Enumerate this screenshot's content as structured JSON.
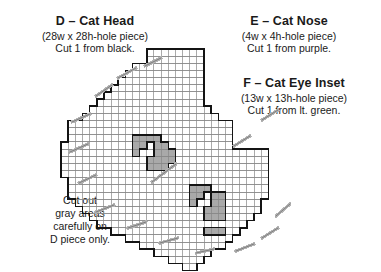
{
  "pieces": [
    {
      "id": "D",
      "title": "D – Cat Head",
      "size_line": "(28w x 28h-hole piece)",
      "cut_line": "Cut 1 from black.",
      "width_holes": 28,
      "height_holes": 28,
      "count": 1,
      "color_name": "black"
    },
    {
      "id": "E",
      "title": "E – Cat Nose",
      "size_line": "(4w x 4h-hole piece)",
      "cut_line": "Cut 1 from purple.",
      "width_holes": 4,
      "height_holes": 4,
      "count": 1,
      "color_name": "purple"
    },
    {
      "id": "F",
      "title": "F – Cat Eye Inset",
      "size_line": "(13w x 13h-hole piece)",
      "cut_line": "Cut 1 from lt. green.",
      "width_holes": 13,
      "height_holes": 13,
      "count": 1,
      "color_name": "lt. green"
    }
  ],
  "note": {
    "line1": "Cut out",
    "line2": "gray areas",
    "line3": "carefully on",
    "line4": "D piece only."
  },
  "colors": {
    "ink": "#1a1a1a",
    "grid_line": "#888888",
    "outline": "#141414",
    "cutout_fill": "#a9a9a9",
    "paper": "#ffffff"
  },
  "chart_data": {
    "type": "grid-pattern",
    "cell_px": 7.15,
    "origin_x": 61,
    "origin_y": 49,
    "cols": 31,
    "rows": 31,
    "outline_note": "Stepped circular head outline, 28 holes wide at center",
    "row_spans": [
      {
        "r": 0,
        "c0": 12,
        "c1": 19
      },
      {
        "r": 1,
        "c0": 12,
        "c1": 19
      },
      {
        "r": 2,
        "c0": 10,
        "c1": 19
      },
      {
        "r": 3,
        "c0": 9,
        "c1": 19
      },
      {
        "r": 4,
        "c0": 8,
        "c1": 19
      },
      {
        "r": 5,
        "c0": 7,
        "c1": 19
      },
      {
        "r": 6,
        "c0": 6,
        "c1": 19
      },
      {
        "r": 7,
        "c0": 5,
        "c1": 19
      },
      {
        "r": 8,
        "c0": 4,
        "c1": 20
      },
      {
        "r": 9,
        "c0": 3,
        "c1": 21
      },
      {
        "r": 10,
        "c0": 1,
        "c1": 23
      },
      {
        "r": 11,
        "c0": 1,
        "c1": 23
      },
      {
        "r": 12,
        "c0": 1,
        "c1": 23
      },
      {
        "r": 13,
        "c0": 0,
        "c1": 23
      },
      {
        "r": 14,
        "c0": 0,
        "c1": 28
      },
      {
        "r": 15,
        "c0": 0,
        "c1": 28
      },
      {
        "r": 16,
        "c0": 0,
        "c1": 28
      },
      {
        "r": 17,
        "c0": 0,
        "c1": 28
      },
      {
        "r": 18,
        "c0": 1,
        "c1": 28
      },
      {
        "r": 19,
        "c0": 1,
        "c1": 28
      },
      {
        "r": 20,
        "c0": 1,
        "c1": 28
      },
      {
        "r": 21,
        "c0": 2,
        "c1": 27
      },
      {
        "r": 22,
        "c0": 3,
        "c1": 27
      },
      {
        "r": 23,
        "c0": 4,
        "c1": 26
      },
      {
        "r": 24,
        "c0": 5,
        "c1": 25
      },
      {
        "r": 25,
        "c0": 7,
        "c1": 24
      },
      {
        "r": 26,
        "c0": 9,
        "c1": 23
      },
      {
        "r": 27,
        "c0": 11,
        "c1": 22
      },
      {
        "r": 28,
        "c0": 13,
        "c1": 20
      },
      {
        "r": 29,
        "c0": 15,
        "c1": 19
      },
      {
        "r": 30,
        "c0": 17,
        "c1": 18
      }
    ],
    "cutout_cells": [
      [
        12,
        10
      ],
      [
        12,
        11
      ],
      [
        12,
        12
      ],
      [
        12,
        13
      ],
      [
        13,
        10
      ],
      [
        13,
        11
      ],
      [
        13,
        13
      ],
      [
        13,
        14
      ],
      [
        14,
        10
      ],
      [
        14,
        13
      ],
      [
        14,
        14
      ],
      [
        14,
        15
      ],
      [
        15,
        12
      ],
      [
        15,
        13
      ],
      [
        15,
        14
      ],
      [
        15,
        15
      ],
      [
        16,
        12
      ],
      [
        16,
        13
      ],
      [
        16,
        14
      ],
      [
        19,
        18
      ],
      [
        19,
        19
      ],
      [
        19,
        20
      ],
      [
        20,
        18
      ],
      [
        20,
        19
      ],
      [
        20,
        21
      ],
      [
        20,
        22
      ],
      [
        21,
        18
      ],
      [
        21,
        21
      ],
      [
        21,
        22
      ],
      [
        22,
        20
      ],
      [
        22,
        21
      ],
      [
        22,
        22
      ],
      [
        23,
        20
      ],
      [
        23,
        21
      ],
      [
        23,
        22
      ],
      [
        25,
        20
      ],
      [
        25,
        21
      ],
      [
        25,
        22
      ]
    ],
    "pointer_leaders": [
      {
        "x1": 96,
        "y1": 96,
        "x2": 112,
        "y2": 85
      },
      {
        "x1": 118,
        "y1": 78,
        "x2": 136,
        "y2": 68
      },
      {
        "x1": 145,
        "y1": 66,
        "x2": 161,
        "y2": 58
      },
      {
        "x1": 72,
        "y1": 122,
        "x2": 90,
        "y2": 114
      },
      {
        "x1": 70,
        "y1": 152,
        "x2": 88,
        "y2": 144
      },
      {
        "x1": 79,
        "y1": 183,
        "x2": 96,
        "y2": 175
      },
      {
        "x1": 96,
        "y1": 212,
        "x2": 114,
        "y2": 205
      },
      {
        "x1": 128,
        "y1": 228,
        "x2": 146,
        "y2": 222
      },
      {
        "x1": 160,
        "y1": 243,
        "x2": 178,
        "y2": 238
      },
      {
        "x1": 196,
        "y1": 253,
        "x2": 214,
        "y2": 249
      },
      {
        "x1": 236,
        "y1": 251,
        "x2": 254,
        "y2": 244
      },
      {
        "x1": 262,
        "y1": 238,
        "x2": 278,
        "y2": 228
      },
      {
        "x1": 276,
        "y1": 216,
        "x2": 290,
        "y2": 204
      },
      {
        "x1": 234,
        "y1": 146,
        "x2": 250,
        "y2": 136
      },
      {
        "x1": 262,
        "y1": 120,
        "x2": 278,
        "y2": 110
      },
      {
        "x1": 152,
        "y1": 182,
        "x2": 176,
        "y2": 164
      }
    ]
  }
}
